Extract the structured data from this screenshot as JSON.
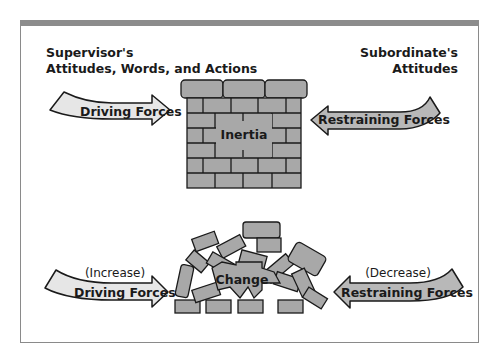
{
  "diagram": {
    "type": "force-field-analysis",
    "top_section": {
      "left_label": [
        "Supervisor's",
        "Attitudes, Words, and Actions"
      ],
      "right_label": [
        "Subordinate's",
        "Attitudes"
      ],
      "driving_arrow": {
        "label": "Driving Forces",
        "direction": "right"
      },
      "restraining_arrow": {
        "label": "Restraining Forces",
        "direction": "left"
      },
      "center": {
        "label": "Inertia",
        "shape": "brick-wall"
      }
    },
    "bottom_section": {
      "driving_arrow": {
        "qualifier": "(Increase)",
        "label": "Driving Forces",
        "direction": "right"
      },
      "restraining_arrow": {
        "qualifier": "(Decrease)",
        "label": "Restraining Forces",
        "direction": "left"
      },
      "center": {
        "label": "Change",
        "shape": "collapsed-bricks"
      }
    },
    "colors": {
      "frame_band": "#8c8c8c",
      "driving_fill": "#e6e6e6",
      "restraining_fill": "#b8b8b8",
      "brick_fill": "#a8a8a8",
      "outline": "#1a1a1a"
    }
  }
}
